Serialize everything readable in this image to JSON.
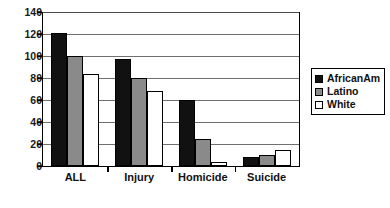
{
  "chart_data": {
    "type": "bar",
    "title": "",
    "subtitle": "",
    "xlabel": "",
    "ylabel": "",
    "categories": [
      "ALL",
      "Injury",
      "Homicide",
      "Suicide"
    ],
    "series": [
      {
        "name": "AfricanAm",
        "color": "#111111",
        "values": [
          121,
          97,
          60,
          8
        ]
      },
      {
        "name": "Latino",
        "color": "#8a8a8a",
        "values": [
          100,
          80,
          25,
          10
        ]
      },
      {
        "name": "White",
        "color": "#ffffff",
        "values": [
          84,
          68,
          4,
          15
        ]
      }
    ],
    "ylim": [
      0,
      140
    ],
    "ytick_step": 20,
    "yticks": [
      0,
      20,
      40,
      60,
      80,
      100,
      120,
      140
    ],
    "ytick_labels": [
      "0",
      "20",
      "40",
      "60",
      "80",
      "100",
      "120",
      "140"
    ],
    "grid": true,
    "grid_axis": "y",
    "legend_position": "right",
    "legend_entries": [
      "AfricanAm",
      "Latino",
      "White"
    ],
    "annotations": []
  },
  "colors": {
    "series_africanam": "#111111",
    "series_latino": "#8a8a8a",
    "series_white": "#ffffff",
    "axis": "#000000",
    "gridline": "#6f6f6f",
    "background": "#ffffff",
    "text": "#111111"
  }
}
